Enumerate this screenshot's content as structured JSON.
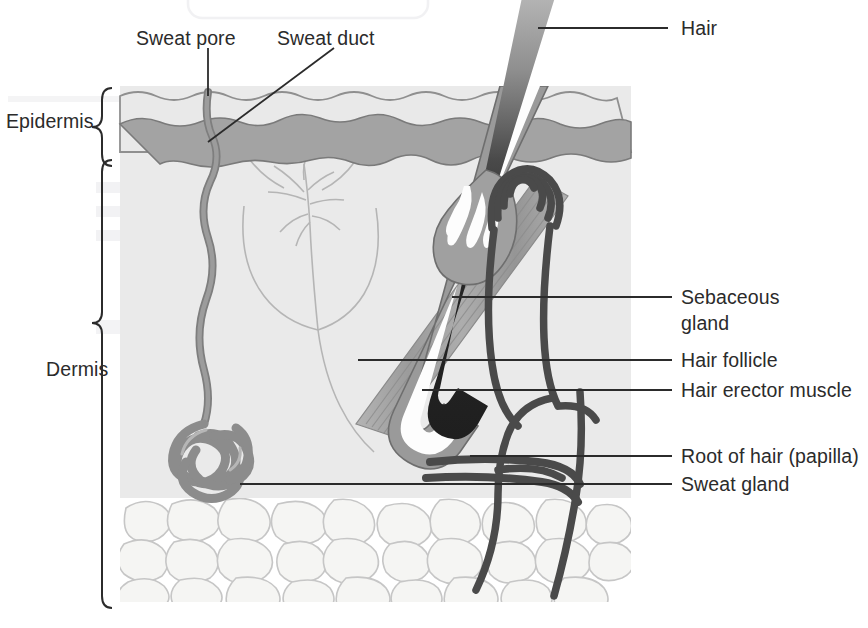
{
  "layers": [
    {
      "id": "epidermis",
      "label": "Epidermis",
      "brace_top": 88,
      "brace_bottom": 158
    },
    {
      "id": "dermis",
      "label": "Dermis",
      "brace_top": 160,
      "brace_bottom": 608
    }
  ],
  "labels": {
    "sweat_pore": "Sweat pore",
    "sweat_duct": "Sweat duct",
    "hair": "Hair",
    "sebaceous_gland_line1": "Sebaceous",
    "sebaceous_gland_line2": "gland",
    "hair_follicle": "Hair follicle",
    "hair_erector_muscle": "Hair erector muscle",
    "root_of_hair": "Root of hair (papilla)",
    "sweat_gland": "Sweat gland",
    "epidermis": "Epidermis",
    "dermis": "Dermis"
  },
  "structures": [
    {
      "name": "hair-shaft",
      "description": "dark hair shaft emerging at an angle"
    },
    {
      "name": "hair-follicle",
      "description": "grey sheath surrounding hair shaft"
    },
    {
      "name": "sebaceous-gland",
      "description": "teardrop gland with white lobules"
    },
    {
      "name": "hair-erector-muscle",
      "description": "striped diagonal muscle band"
    },
    {
      "name": "sweat-duct",
      "description": "dark coiled duct with arched opening"
    },
    {
      "name": "sweat-gland",
      "description": "tangled coil of tubing in deep dermis"
    },
    {
      "name": "sweat-pore-channel",
      "description": "wavy channel from surface to sweat gland"
    },
    {
      "name": "nerve-tree",
      "description": "faint branching nerve below epidermis"
    },
    {
      "name": "blood-vessels",
      "description": "dark curved vessels feeding the papilla"
    },
    {
      "name": "subcutaneous-fat",
      "description": "layer of rounded fat cells"
    }
  ],
  "colors": {
    "epidermis_upper": "#e9e9e9",
    "epidermis_lower": "#a3a3a3",
    "dermis": "#eaeaea",
    "hair_shaft_dark": "#262626",
    "follicle_sheath": "#9a9a9a",
    "sebaceous_gland": "#a0a0a0",
    "muscle": "#9f9f9f",
    "duct_dark": "#4a4a4a",
    "sweat_gland": "#8c8c8c",
    "fat_cell_fill": "#f4f4f2",
    "fat_cell_stroke": "#c9c9c9",
    "leader_line": "#2b2b2b",
    "text": "#2b2b2b"
  }
}
